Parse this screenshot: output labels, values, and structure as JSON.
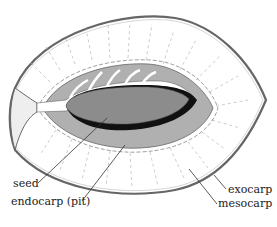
{
  "diagram": {
    "labels": {
      "seed": "seed",
      "endocarp": "endocarp (pit)",
      "exocarp": "exocarp",
      "mesocarp": "mesocarp"
    },
    "colors": {
      "outline": "#555555",
      "endocarp_fill": "#b0b0b0",
      "seed_fill": "#8c8c8c",
      "seed_coat": "#111111",
      "background": "#ffffff"
    }
  }
}
